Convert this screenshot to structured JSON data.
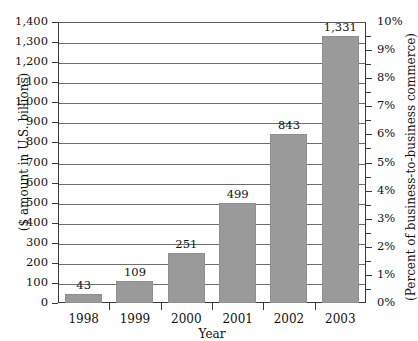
{
  "chart_data": {
    "type": "bar",
    "title": "",
    "subtitle": "",
    "xlabel": "Year",
    "ylabel": "($ amount in U.S. billions)",
    "y2label": "(Percent of business-to-business commerce)",
    "categories": [
      "1998",
      "1999",
      "2000",
      "2001",
      "2002",
      "2003"
    ],
    "values": [
      43,
      109,
      251,
      499,
      843,
      1331
    ],
    "value_labels": [
      "43",
      "109",
      "251",
      "499",
      "843",
      "1,331"
    ],
    "series": [
      {
        "name": "E-commerce dollar amount",
        "values": [
          43,
          109,
          251,
          499,
          843,
          1331
        ]
      }
    ],
    "ylim": [
      0,
      1400
    ],
    "yticks": [
      0,
      100,
      200,
      300,
      400,
      500,
      600,
      700,
      800,
      900,
      1000,
      1100,
      1200,
      1300,
      1400
    ],
    "ytick_labels": [
      "0",
      "100",
      "200",
      "300",
      "400",
      "500",
      "600",
      "700",
      "800",
      "900",
      "1,000",
      "1,100",
      "1,200",
      "1,300",
      "1,400"
    ],
    "y2lim": [
      0,
      10
    ],
    "y2ticks": [
      0,
      1,
      2,
      3,
      4,
      5,
      6,
      7,
      8,
      9,
      10
    ],
    "y2tick_labels": [
      "0%",
      "1%",
      "2%",
      "3%",
      "4%",
      "5%",
      "6%",
      "7%",
      "8%",
      "9%",
      "10%"
    ],
    "y2_minor_ticks": [
      0.5,
      1.5,
      2.5,
      3.5,
      4.5,
      5.5,
      6.5,
      7.5,
      8.5,
      9.5
    ],
    "grid": true,
    "grid_axis": "y",
    "legend": false,
    "legend_position": "none",
    "bar_color": "#9a9a9a",
    "bar_border_color": "#8f8f8f",
    "axis_color": "#3a3a3a",
    "gridline_color": "#6e6e6e",
    "text_color": "#111111",
    "background_color": "#ffffff"
  }
}
